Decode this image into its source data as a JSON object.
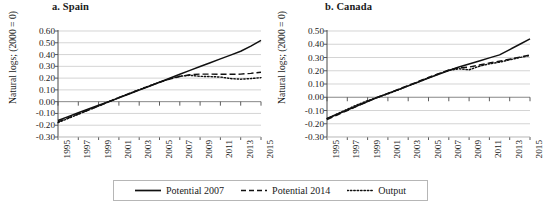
{
  "figure": {
    "y_axis_label": "Natural logs; (2000 = 0)"
  },
  "legend": {
    "items": [
      {
        "label": "Potential 2007",
        "style": "solid",
        "icon": "solid-line-icon"
      },
      {
        "label": "Potential 2014",
        "style": "dashed",
        "icon": "dashed-line-icon"
      },
      {
        "label": "Output",
        "style": "dotted",
        "icon": "dotted-line-icon"
      }
    ]
  },
  "chart_data": [
    {
      "type": "line",
      "title": "a. Spain",
      "xlabel": "",
      "ylabel": "Natural logs; (2000 = 0)",
      "grid": true,
      "legend_position": "bottom",
      "xlim": [
        1995,
        2015
      ],
      "ylim": [
        -0.3,
        0.6
      ],
      "ytick_labels": [
        "0.60",
        "0.50",
        "0.40",
        "0.30",
        "0.20",
        "0.10",
        "0.00",
        "-0.10",
        "-0.20",
        "-0.30"
      ],
      "ytick_values": [
        0.6,
        0.5,
        0.4,
        0.3,
        0.2,
        0.1,
        0.0,
        -0.1,
        -0.2,
        -0.3
      ],
      "xtick_labels": [
        "1995",
        "1997",
        "1999",
        "2001",
        "2003",
        "2005",
        "2007",
        "2009",
        "2011",
        "2013",
        "2015"
      ],
      "xtick_values": [
        1995,
        1997,
        1999,
        2001,
        2003,
        2005,
        2007,
        2009,
        2011,
        2013,
        2015
      ],
      "x": [
        1995,
        1996,
        1997,
        1998,
        1999,
        2000,
        2001,
        2002,
        2003,
        2004,
        2005,
        2006,
        2007,
        2008,
        2009,
        2010,
        2011,
        2012,
        2013,
        2014,
        2015
      ],
      "series": [
        {
          "name": "Potential 2007",
          "style": "solid",
          "values": [
            -0.16,
            -0.127,
            -0.094,
            -0.062,
            -0.031,
            0.0,
            0.032,
            0.065,
            0.098,
            0.131,
            0.165,
            0.199,
            0.233,
            0.266,
            0.299,
            0.331,
            0.363,
            0.395,
            0.428,
            0.471,
            0.52
          ]
        },
        {
          "name": "Potential 2014",
          "style": "dashed",
          "values": [
            -0.172,
            -0.139,
            -0.105,
            -0.071,
            -0.037,
            0.0,
            0.034,
            0.068,
            0.101,
            0.134,
            0.164,
            0.192,
            0.214,
            0.228,
            0.234,
            0.234,
            0.233,
            0.232,
            0.234,
            0.24,
            0.25
          ]
        },
        {
          "name": "Output",
          "style": "dotted",
          "values": [
            -0.178,
            -0.142,
            -0.107,
            -0.072,
            -0.037,
            0.0,
            0.035,
            0.069,
            0.102,
            0.134,
            0.165,
            0.194,
            0.216,
            0.224,
            0.215,
            0.213,
            0.209,
            0.196,
            0.191,
            0.196,
            0.204
          ]
        }
      ]
    },
    {
      "type": "line",
      "title": "b. Canada",
      "xlabel": "",
      "ylabel": "Natural logs; (2000 = 0)",
      "grid": true,
      "legend_position": "bottom",
      "xlim": [
        1995,
        2015
      ],
      "ylim": [
        -0.3,
        0.5
      ],
      "ytick_labels": [
        "0.50",
        "0.40",
        "0.30",
        "0.20",
        "0.10",
        "0.00",
        "-0.10",
        "-0.20",
        "-0.30"
      ],
      "ytick_values": [
        0.5,
        0.4,
        0.3,
        0.2,
        0.1,
        0.0,
        -0.1,
        -0.2,
        -0.3
      ],
      "xtick_labels": [
        "1995",
        "1997",
        "1999",
        "2001",
        "2003",
        "2005",
        "2007",
        "2009",
        "2011",
        "2013",
        "2015"
      ],
      "xtick_values": [
        1995,
        1997,
        1999,
        2001,
        2003,
        2005,
        2007,
        2009,
        2011,
        2013,
        2015
      ],
      "x": [
        1995,
        1996,
        1997,
        1998,
        1999,
        2000,
        2001,
        2002,
        2003,
        2004,
        2005,
        2006,
        2007,
        2008,
        2009,
        2010,
        2011,
        2012,
        2013,
        2014,
        2015
      ],
      "series": [
        {
          "name": "Potential 2007",
          "style": "solid",
          "values": [
            -0.16,
            -0.128,
            -0.096,
            -0.064,
            -0.032,
            0.0,
            0.028,
            0.057,
            0.086,
            0.115,
            0.144,
            0.173,
            0.202,
            0.228,
            0.251,
            0.274,
            0.297,
            0.32,
            0.36,
            0.4,
            0.44
          ]
        },
        {
          "name": "Potential 2014",
          "style": "dashed",
          "values": [
            -0.168,
            -0.134,
            -0.1,
            -0.066,
            -0.032,
            0.0,
            0.029,
            0.059,
            0.089,
            0.119,
            0.149,
            0.178,
            0.206,
            0.222,
            0.228,
            0.243,
            0.258,
            0.272,
            0.287,
            0.303,
            0.32
          ]
        },
        {
          "name": "Output",
          "style": "dotted",
          "values": [
            -0.162,
            -0.126,
            -0.09,
            -0.056,
            -0.026,
            0.0,
            0.026,
            0.055,
            0.085,
            0.116,
            0.147,
            0.176,
            0.203,
            0.215,
            0.207,
            0.234,
            0.252,
            0.265,
            0.283,
            0.3,
            0.315
          ]
        }
      ]
    }
  ]
}
